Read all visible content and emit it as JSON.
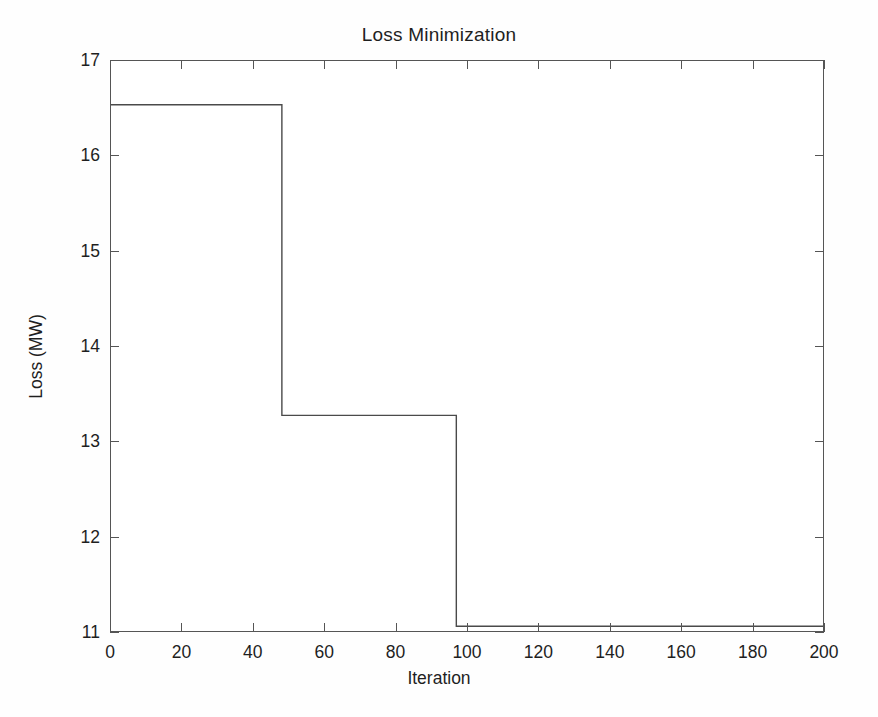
{
  "figure": {
    "title": "Loss Minimization",
    "background_color": "#fefefe",
    "plot_background_color": "#ffffff",
    "axis_color": "#555555",
    "line_color": "#4a4a4a"
  },
  "axes": {
    "x_title": "Iteration",
    "y_title": "Loss (MW)",
    "x_ticks": [
      "0",
      "20",
      "40",
      "60",
      "80",
      "100",
      "120",
      "140",
      "160",
      "180",
      "200"
    ],
    "y_ticks": [
      "11",
      "12",
      "13",
      "14",
      "15",
      "16",
      "17"
    ]
  },
  "chart_data": {
    "type": "line",
    "title": "Loss Minimization",
    "xlabel": "Iteration",
    "ylabel": "Loss (MW)",
    "xlim": [
      0,
      200
    ],
    "ylim": [
      11,
      17
    ],
    "xticks": [
      0,
      20,
      40,
      60,
      80,
      100,
      120,
      140,
      160,
      180,
      200
    ],
    "yticks": [
      11,
      12,
      13,
      14,
      15,
      16,
      17
    ],
    "grid": false,
    "legend": null,
    "drawstyle": "steps-post",
    "series": [
      {
        "name": "Loss",
        "color": "#4a4a4a",
        "x": [
          0,
          48,
          48,
          97,
          97,
          200
        ],
        "y": [
          16.54,
          16.54,
          13.27,
          13.27,
          11.05,
          11.05
        ],
        "steps": [
          {
            "from_iteration": 0,
            "to_iteration": 48,
            "loss_mw": 16.54
          },
          {
            "from_iteration": 48,
            "to_iteration": 97,
            "loss_mw": 13.27
          },
          {
            "from_iteration": 97,
            "to_iteration": 200,
            "loss_mw": 11.05
          }
        ]
      }
    ]
  }
}
